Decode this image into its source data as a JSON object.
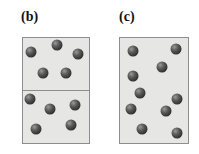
{
  "panels": [
    {
      "label": "(b)",
      "label_pos": [
        21,
        10
      ],
      "box": {
        "x": 22,
        "y": 37,
        "w": 68,
        "h": 107
      },
      "divider_y": 53,
      "spheres": [
        [
          31,
          52
        ],
        [
          57,
          45
        ],
        [
          78,
          54
        ],
        [
          43,
          73
        ],
        [
          66,
          73
        ],
        [
          30,
          99
        ],
        [
          50,
          109
        ],
        [
          75,
          105
        ],
        [
          36,
          129
        ],
        [
          71,
          125
        ]
      ]
    },
    {
      "label": "(c)",
      "label_pos": [
        119,
        10
      ],
      "box": {
        "x": 119,
        "y": 37,
        "w": 70,
        "h": 107
      },
      "divider_y": null,
      "spheres": [
        [
          133,
          51
        ],
        [
          176,
          49
        ],
        [
          162,
          67
        ],
        [
          133,
          76
        ],
        [
          140,
          93
        ],
        [
          177,
          99
        ],
        [
          131,
          109
        ],
        [
          166,
          111
        ],
        [
          142,
          129
        ],
        [
          177,
          133
        ]
      ]
    }
  ],
  "colors": {
    "box_fill": "#e6e6e4",
    "box_border": "#8e8e8e",
    "sphere": "#3a3a3a"
  }
}
